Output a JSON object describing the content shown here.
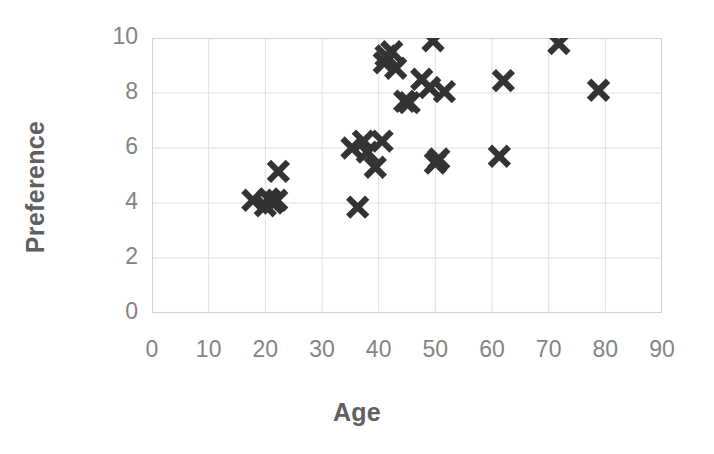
{
  "chart_data": {
    "type": "scatter",
    "title": "",
    "xlabel": "Age",
    "ylabel": "Preference",
    "xlim": [
      0,
      90
    ],
    "ylim": [
      0,
      10
    ],
    "xticks": [
      0,
      10,
      20,
      30,
      40,
      50,
      60,
      70,
      80,
      90
    ],
    "yticks": [
      0,
      2,
      4,
      6,
      8,
      10
    ],
    "grid": true,
    "legend": false,
    "marker": "x",
    "marker_color": "#333333",
    "axis_label_color": "#848484",
    "axis_title_color": "#606060",
    "gridline_color": "#e0e0e0",
    "points": [
      {
        "x": 17.8,
        "y": 4.1
      },
      {
        "x": 20.0,
        "y": 3.9
      },
      {
        "x": 20.6,
        "y": 4.15
      },
      {
        "x": 21.3,
        "y": 4.0
      },
      {
        "x": 22.0,
        "y": 4.1
      },
      {
        "x": 22.3,
        "y": 5.15
      },
      {
        "x": 35.3,
        "y": 6.0
      },
      {
        "x": 36.3,
        "y": 3.85
      },
      {
        "x": 37.3,
        "y": 6.25
      },
      {
        "x": 38.0,
        "y": 5.85
      },
      {
        "x": 39.4,
        "y": 5.3
      },
      {
        "x": 40.6,
        "y": 6.25
      },
      {
        "x": 41.0,
        "y": 9.1
      },
      {
        "x": 41.3,
        "y": 9.35
      },
      {
        "x": 42.3,
        "y": 9.5
      },
      {
        "x": 43.0,
        "y": 8.9
      },
      {
        "x": 44.6,
        "y": 7.7
      },
      {
        "x": 45.4,
        "y": 7.65
      },
      {
        "x": 47.6,
        "y": 8.5
      },
      {
        "x": 49.0,
        "y": 8.2
      },
      {
        "x": 49.6,
        "y": 9.9
      },
      {
        "x": 50.0,
        "y": 5.45
      },
      {
        "x": 50.6,
        "y": 5.6
      },
      {
        "x": 51.6,
        "y": 8.05
      },
      {
        "x": 61.3,
        "y": 5.7
      },
      {
        "x": 62.0,
        "y": 8.45
      },
      {
        "x": 71.8,
        "y": 9.8
      },
      {
        "x": 78.8,
        "y": 8.1
      }
    ]
  }
}
